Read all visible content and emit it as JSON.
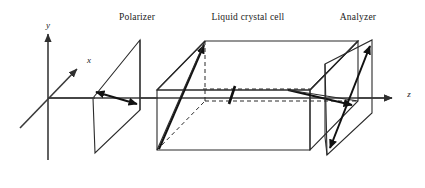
{
  "figure": {
    "background_color": "#ffffff",
    "line_color": "#2b2b2b",
    "axis_color": "#3a3a3a",
    "width": 425,
    "height": 188
  },
  "labels": {
    "polarizer": "Polarizer",
    "liquid_crystal_cell": "Liquid crystal cell",
    "analyzer": "Analyzer"
  },
  "axes": {
    "y_label": "y",
    "x_label": "x",
    "z_label": "z",
    "origin": {
      "x": 48,
      "y": 98
    },
    "y_tip": {
      "x": 48,
      "y": 30
    },
    "x_tip": {
      "x": 80,
      "y": 66
    },
    "z_tip": {
      "x": 400,
      "y": 98
    }
  },
  "components": [
    {
      "name": "polarizer",
      "label": "Polarizer",
      "label_position": {
        "x": 137,
        "y": 18
      },
      "shape": "parallelogram",
      "director": "horizontal-slanted double arrow",
      "transmission_axis_degrees": 0
    },
    {
      "name": "liquid-crystal-cell",
      "label": "Liquid crystal cell",
      "label_position": {
        "x": 248,
        "y": 18
      },
      "shape": "cuboid",
      "director_entry": "vertical",
      "director_mid": "45 degrees",
      "director_exit": "horizontal",
      "twist_degrees": 90
    },
    {
      "name": "analyzer",
      "label": "Analyzer",
      "label_position": {
        "x": 358,
        "y": 18
      },
      "shape": "parallelogram",
      "director": "vertical-slanted double arrow",
      "transmission_axis_degrees": 90
    }
  ]
}
